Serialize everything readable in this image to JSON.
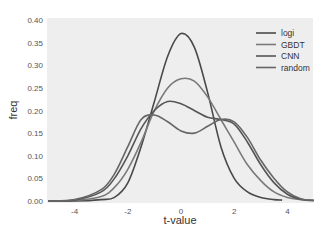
{
  "chart_data": {
    "type": "line",
    "title": "",
    "xlabel": "t-value",
    "ylabel": "freq",
    "xlim": [
      -5,
      5
    ],
    "ylim": [
      0,
      0.4
    ],
    "xticks": [
      -4,
      -2,
      0,
      2,
      4
    ],
    "xtick_labels": [
      "-4",
      "-2",
      "0",
      "2",
      "4"
    ],
    "yticks": [
      0.0,
      0.05,
      0.1,
      0.15,
      0.2,
      0.25,
      0.3,
      0.35,
      0.4
    ],
    "ytick_labels": [
      "0.00",
      "0.05",
      "0.10",
      "0.15",
      "0.20",
      "0.25",
      "0.30",
      "0.35",
      "0.40"
    ],
    "grid": false,
    "background": "#eeeeee",
    "legend_position": "upper right",
    "series": [
      {
        "name": "logi",
        "color": "#4a4a4a",
        "x": [
          -5,
          -4,
          -3,
          -2.5,
          -2,
          -1.5,
          -1,
          -0.5,
          0,
          0.5,
          1,
          1.5,
          2,
          2.5,
          3,
          3.5,
          3.8
        ],
        "y": [
          0.0,
          0.0,
          0.003,
          0.008,
          0.04,
          0.12,
          0.22,
          0.32,
          0.37,
          0.34,
          0.24,
          0.12,
          0.05,
          0.02,
          0.008,
          0.003,
          0.002
        ]
      },
      {
        "name": "GBDT",
        "color": "#7a7a7a",
        "x": [
          -5,
          -4,
          -3,
          -2.5,
          -2,
          -1.5,
          -1,
          -0.5,
          0,
          0.5,
          1,
          1.5,
          2,
          2.5,
          3,
          3.5,
          4,
          4.5,
          5
        ],
        "y": [
          0.0,
          0.001,
          0.01,
          0.03,
          0.07,
          0.13,
          0.2,
          0.25,
          0.27,
          0.265,
          0.23,
          0.18,
          0.13,
          0.08,
          0.045,
          0.02,
          0.008,
          0.003,
          0.001
        ]
      },
      {
        "name": "CNN",
        "color": "#555555",
        "x": [
          -5,
          -4,
          -3,
          -2.5,
          -2,
          -1.5,
          -1,
          -0.5,
          0,
          0.5,
          1,
          1.5,
          2,
          2.5,
          3,
          3.5,
          4,
          4.5,
          5
        ],
        "y": [
          0.0,
          0.002,
          0.02,
          0.05,
          0.1,
          0.16,
          0.2,
          0.22,
          0.215,
          0.2,
          0.185,
          0.18,
          0.17,
          0.13,
          0.08,
          0.04,
          0.015,
          0.004,
          0.001
        ]
      },
      {
        "name": "random",
        "color": "#666666",
        "x": [
          -5,
          -4,
          -3,
          -2.5,
          -2,
          -1.5,
          -1,
          -0.5,
          0,
          0.5,
          1,
          1.5,
          2,
          2.5,
          3,
          3.5,
          4,
          4.5,
          5
        ],
        "y": [
          0.0,
          0.003,
          0.025,
          0.06,
          0.12,
          0.18,
          0.19,
          0.175,
          0.155,
          0.15,
          0.165,
          0.18,
          0.175,
          0.14,
          0.09,
          0.05,
          0.02,
          0.005,
          0.001
        ]
      }
    ]
  }
}
